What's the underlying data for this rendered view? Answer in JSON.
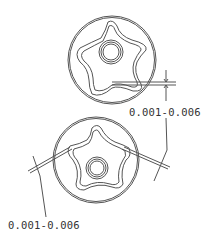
{
  "figure": {
    "views": [
      {
        "name": "outer-rotor-to-inner-rotor tip clearance",
        "clearance_label": "0.001-0.006"
      },
      {
        "name": "rotor side clearance",
        "clearance_label": "0.001-0.006"
      }
    ],
    "colors": {
      "line": "#555555",
      "background": "#ffffff",
      "text": "#333333"
    }
  }
}
